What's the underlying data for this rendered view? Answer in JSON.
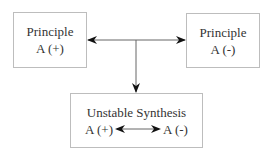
{
  "diagram": {
    "nodes": [
      {
        "id": "left",
        "title": "Principle",
        "subtitle": "A (+)"
      },
      {
        "id": "right",
        "title": "Principle",
        "subtitle": "A (-)"
      },
      {
        "id": "bottom",
        "title": "Unstable Synthesis",
        "left_label": "A (+)",
        "right_label": "A (-)"
      }
    ],
    "edges": [
      {
        "from": "center",
        "to": "left",
        "type": "arrow"
      },
      {
        "from": "center",
        "to": "right",
        "type": "arrow"
      },
      {
        "from": "center",
        "to": "bottom",
        "type": "arrow"
      },
      {
        "from": "A (+)",
        "to": "A (-)",
        "type": "bidirectional-arrow"
      }
    ],
    "colors": {
      "border": "#bdbdbd",
      "line": "#555555",
      "arrowhead": "#111111",
      "text": "#333333"
    }
  }
}
